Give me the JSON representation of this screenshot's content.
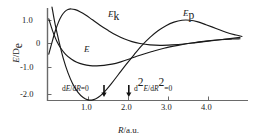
{
  "chart_data": {
    "type": "line",
    "title": "",
    "xlabel": "R/a.u.",
    "ylabel": "E/D_e",
    "xlim": [
      -0.2,
      5.0
    ],
    "ylim": [
      -2.6,
      1.75
    ],
    "grid": false,
    "legend_position": "inline-curve-labels",
    "xticks": [
      "1.0",
      "2.0",
      "3.0",
      "4.0"
    ],
    "xtick_values": [
      1.0,
      2.0,
      3.0,
      4.0
    ],
    "yticks": [
      "1.0",
      "0",
      "-1.0",
      "-2.0"
    ],
    "ytick_values": [
      1.0,
      0.0,
      -1.0,
      -2.0
    ],
    "series": [
      {
        "name": "E_k",
        "label": "E",
        "label_sub": "k",
        "description": "kinetic energy curve",
        "color": "#1a1a1a",
        "points": [
          [
            0.02,
            -0.45
          ],
          [
            0.1,
            0.05
          ],
          [
            0.18,
            0.52
          ],
          [
            0.26,
            0.9
          ],
          [
            0.34,
            1.18
          ],
          [
            0.42,
            1.36
          ],
          [
            0.5,
            1.45
          ],
          [
            0.58,
            1.47
          ],
          [
            0.68,
            1.44
          ],
          [
            0.8,
            1.35
          ],
          [
            0.95,
            1.2
          ],
          [
            1.1,
            1.02
          ],
          [
            1.3,
            0.78
          ],
          [
            1.5,
            0.56
          ],
          [
            1.7,
            0.36
          ],
          [
            1.9,
            0.2
          ],
          [
            2.1,
            0.08
          ],
          [
            2.3,
            0.0
          ],
          [
            2.55,
            -0.06
          ],
          [
            2.8,
            -0.08
          ],
          [
            3.1,
            -0.06
          ],
          [
            3.4,
            -0.02
          ],
          [
            3.7,
            0.04
          ],
          [
            4.0,
            0.1
          ],
          [
            4.3,
            0.16
          ],
          [
            4.6,
            0.22
          ],
          [
            4.8,
            0.26
          ]
        ]
      },
      {
        "name": "E",
        "label": "E",
        "label_sub": "",
        "description": "total energy curve",
        "color": "#1a1a1a",
        "points": [
          [
            0.02,
            1.05
          ],
          [
            0.08,
            0.72
          ],
          [
            0.14,
            0.42
          ],
          [
            0.22,
            0.1
          ],
          [
            0.32,
            -0.2
          ],
          [
            0.44,
            -0.46
          ],
          [
            0.58,
            -0.66
          ],
          [
            0.72,
            -0.8
          ],
          [
            0.88,
            -0.89
          ],
          [
            1.05,
            -0.94
          ],
          [
            1.22,
            -0.95
          ],
          [
            1.4,
            -0.93
          ],
          [
            1.6,
            -0.88
          ],
          [
            1.82,
            -0.78
          ],
          [
            2.05,
            -0.65
          ],
          [
            2.3,
            -0.5
          ],
          [
            2.6,
            -0.34
          ],
          [
            2.9,
            -0.2
          ],
          [
            3.25,
            -0.08
          ],
          [
            3.6,
            0.02
          ],
          [
            3.95,
            0.1
          ],
          [
            4.3,
            0.16
          ],
          [
            4.6,
            0.19
          ],
          [
            4.8,
            0.2
          ]
        ]
      },
      {
        "name": "E_p",
        "label": "E",
        "label_sub": "p",
        "description": "potential energy curve",
        "color": "#1a1a1a",
        "points": [
          [
            0.1,
            1.55
          ],
          [
            0.18,
            0.8
          ],
          [
            0.28,
            0.05
          ],
          [
            0.38,
            -0.62
          ],
          [
            0.5,
            -1.25
          ],
          [
            0.62,
            -1.72
          ],
          [
            0.75,
            -2.08
          ],
          [
            0.88,
            -2.3
          ],
          [
            1.0,
            -2.4
          ],
          [
            1.12,
            -2.4
          ],
          [
            1.25,
            -2.3
          ],
          [
            1.4,
            -2.08
          ],
          [
            1.58,
            -1.72
          ],
          [
            1.76,
            -1.32
          ],
          [
            1.95,
            -0.9
          ],
          [
            2.15,
            -0.48
          ],
          [
            2.35,
            -0.08
          ],
          [
            2.55,
            0.26
          ],
          [
            2.75,
            0.54
          ],
          [
            2.95,
            0.76
          ],
          [
            3.15,
            0.91
          ],
          [
            3.35,
            0.99
          ],
          [
            3.55,
            0.99
          ],
          [
            3.75,
            0.92
          ],
          [
            3.95,
            0.8
          ],
          [
            4.2,
            0.64
          ],
          [
            4.45,
            0.48
          ],
          [
            4.7,
            0.36
          ],
          [
            4.85,
            0.3
          ]
        ]
      }
    ],
    "annotations": [
      {
        "id": "first-derivative-zero",
        "text": "dE/dR=0",
        "text_parts": {
          "d1": "d",
          "E": "E",
          "slash": "/",
          "d2": "d",
          "R": "R",
          "eq": "=0"
        },
        "x": 1.4,
        "marker": "down-arrow"
      },
      {
        "id": "second-derivative-zero",
        "text": "d²E/dR²=0",
        "text_parts": {
          "d1": "d",
          "sup1": "2",
          "E": "E",
          "slash": "/",
          "d2": "d",
          "R": "R",
          "sup2": "2",
          "eq": "=0"
        },
        "x": 2.02,
        "marker": "down-arrow"
      }
    ]
  },
  "axes": {
    "y_title_main": "E",
    "y_title_slash": "/",
    "y_title_d": "D",
    "y_title_sub": "e",
    "x_title_main": "R",
    "x_title_rest": "/a.u."
  },
  "colors": {
    "curve": "#1a1a1a",
    "axis": "#555555",
    "background": "#ffffff",
    "text": "#1a1a1a"
  }
}
